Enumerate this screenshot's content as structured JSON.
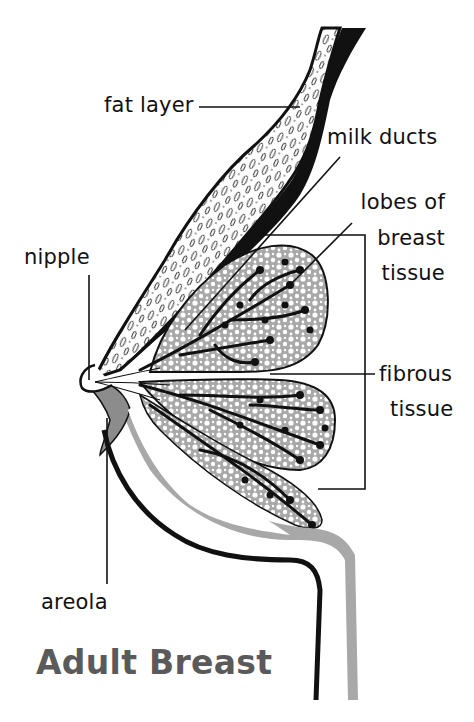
{
  "title": {
    "text": "Adult Breast",
    "color": "#5a5a5a"
  },
  "labels": {
    "fat_layer": "fat layer",
    "milk_ducts": "milk ducts",
    "lobes_line1": "lobes of",
    "lobes_line2": "breast",
    "lobes_line3": "tissue",
    "nipple": "nipple",
    "fibrous_line1": "fibrous",
    "fibrous_line2": "tissue",
    "areola": "areola"
  },
  "colors": {
    "ink": "#111111",
    "gray_fill": "#9a9a9a",
    "light_gray": "#b5b5b5",
    "white": "#ffffff"
  }
}
